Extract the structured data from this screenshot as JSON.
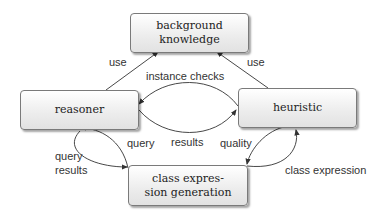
{
  "nodes": {
    "background_knowledge": "background knowledge",
    "reasoner": "reasoner",
    "heuristic": "heuristic",
    "class_expression_generation": "class expres-\nsion generation"
  },
  "edges": {
    "use_left": "use",
    "use_right": "use",
    "instance_checks": "instance checks",
    "results_mid": "results",
    "query_mid": "query",
    "query_results_1": "query",
    "query_results_2": "results",
    "quality": "quality",
    "class_expression": "class expression"
  }
}
